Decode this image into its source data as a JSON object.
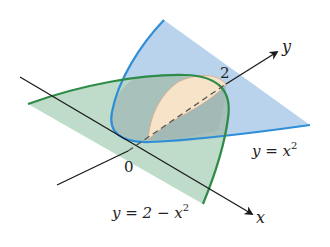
{
  "figure": {
    "colors": {
      "blue_curve": "#2f8fd6",
      "blue_fill": "#aecbea",
      "green_curve": "#2e8b48",
      "green_fill": "#b3d6bf",
      "overlap_fill": "#a9bfb8",
      "cross_section": "#f6e3c8",
      "cross_section_edge": "#d9a88a",
      "axis": "#1a1a1a"
    },
    "labels": {
      "origin": "0",
      "y_axis": "y",
      "x_axis": "x",
      "y_intercept": "2",
      "curve1_lhs": "y = x",
      "curve1_exp": "2",
      "curve2_lhs": "y = 2 − x",
      "curve2_exp": "2"
    }
  }
}
